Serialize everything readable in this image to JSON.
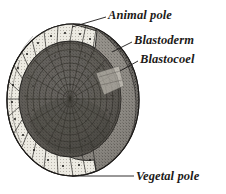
{
  "figure": {
    "background_color": "#ffffff",
    "ink_color": "#1c1a18",
    "labels": [
      {
        "id": "animal-pole",
        "text": "Animal pole"
      },
      {
        "id": "blastoderm",
        "text": "Blastoderm"
      },
      {
        "id": "blastocoel",
        "text": "Blastocoel"
      },
      {
        "id": "vegetal-pole",
        "text": "Vegetal pole"
      }
    ],
    "regions": {
      "blastoderm_fill": "#e4e1d8",
      "outer_surface_fill": "#8d8a84",
      "blastocoel_lining_fill": "#6e6b66",
      "inner_shadow_fill": "#55524e"
    }
  }
}
